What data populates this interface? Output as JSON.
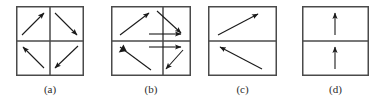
{
  "figure": {
    "background_color": "#ffffff",
    "border_color": "#4a4a4a",
    "arrow_color": "#1a1a1a",
    "label_color": "#2b2b2b"
  },
  "panels": [
    {
      "id": "a",
      "label": "(a)",
      "width": 68,
      "height": 70,
      "grid": "2x2",
      "dividers": [
        "vertical-center",
        "horizontal-center"
      ],
      "arrows": [
        {
          "cell": "top-left",
          "direction": "up-right",
          "x1": 6,
          "y1": 29,
          "x2": 28,
          "y2": 7
        },
        {
          "cell": "top-right",
          "direction": "down-right",
          "x1": 39,
          "y1": 7,
          "x2": 61,
          "y2": 29
        },
        {
          "cell": "bottom-left",
          "direction": "up-left",
          "x1": 28,
          "y1": 62,
          "x2": 7,
          "y2": 41
        },
        {
          "cell": "bottom-right",
          "direction": "down-left",
          "x1": 62,
          "y1": 40,
          "x2": 39,
          "y2": 62
        }
      ]
    },
    {
      "id": "b",
      "label": "(b)",
      "width": 80,
      "height": 70,
      "grid": "2x2-offset",
      "dividers": [
        "vertical-offset-right",
        "horizontal-center"
      ],
      "vertical_divider_x": 52,
      "arrows": [
        {
          "cell": "top-left",
          "direction": "up-right",
          "x1": 9,
          "y1": 29,
          "x2": 38,
          "y2": 7
        },
        {
          "cell": "top-right",
          "direction": "down-right",
          "x1": 46,
          "y1": 5,
          "x2": 70,
          "y2": 27
        },
        {
          "cell": "top-cross",
          "direction": "right",
          "x1": 38,
          "y1": 28,
          "x2": 70,
          "y2": 28
        },
        {
          "cell": "bottom-cross",
          "direction": "right",
          "x1": 38,
          "y1": 41,
          "x2": 70,
          "y2": 41
        },
        {
          "cell": "bottom-left",
          "direction": "down-right",
          "x1": 9,
          "y1": 41,
          "x2": 40,
          "y2": 64
        },
        {
          "cell": "bottom-right",
          "direction": "down-left",
          "x1": 72,
          "y1": 44,
          "x2": 55,
          "y2": 63
        }
      ]
    },
    {
      "id": "c",
      "label": "(c)",
      "width": 69,
      "height": 70,
      "grid": "1x2",
      "dividers": [
        "horizontal-center"
      ],
      "arrows": [
        {
          "cell": "top",
          "direction": "up-right",
          "x1": 10,
          "y1": 29,
          "x2": 50,
          "y2": 8
        },
        {
          "cell": "bottom",
          "direction": "up-left",
          "x1": 54,
          "y1": 63,
          "x2": 12,
          "y2": 41
        }
      ]
    },
    {
      "id": "d",
      "label": "(d)",
      "width": 67,
      "height": 70,
      "grid": "1x2",
      "dividers": [
        "horizontal-center"
      ],
      "arrows": [
        {
          "cell": "top",
          "direction": "up",
          "x1": 33,
          "y1": 29,
          "x2": 33,
          "y2": 7
        },
        {
          "cell": "bottom",
          "direction": "up",
          "x1": 33,
          "y1": 63,
          "x2": 33,
          "y2": 41
        }
      ]
    }
  ]
}
